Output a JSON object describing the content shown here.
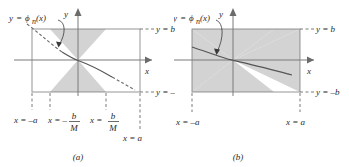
{
  "figure": {
    "title": "",
    "type": "math-diagram"
  },
  "colors": {
    "shade": "#d0d0d0",
    "line": "#6b6b6b",
    "curve": "#555555",
    "text": "#2a2a2a",
    "background": "#ffffff"
  },
  "panel_a": {
    "caption": "(a)",
    "function_label": {
      "y": "y",
      "eq": "=",
      "phi": "ϕ",
      "sub": "n",
      "arg": "(x)"
    },
    "axis_labels": {
      "x": "x",
      "y": "y"
    },
    "right_labels": {
      "top": "y = b",
      "bottom": "y = –b"
    },
    "bottom_labels": [
      {
        "prefix": "x = –a",
        "num": "",
        "den": ""
      },
      {
        "prefix": "x = –",
        "num": "b",
        "den": "M"
      },
      {
        "prefix": "x = ",
        "num": "b",
        "den": "M"
      }
    ],
    "corner_label": "x = a",
    "geometry": {
      "box_left": 32,
      "box_right": 140,
      "box_top": 29,
      "box_bottom": 92,
      "origin_x": 78,
      "origin_y": 60,
      "cone_half_width": 28
    }
  },
  "panel_b": {
    "caption": "(b)",
    "function_label": {
      "y": "y",
      "eq": "=",
      "phi": "ϕ",
      "sub": "n",
      "arg": "(x)"
    },
    "axis_labels": {
      "x": "x",
      "y": "y"
    },
    "right_labels": {
      "top": "y = b",
      "bottom": "y = –b"
    },
    "bottom_labels": [
      {
        "prefix": "x = –a",
        "num": "",
        "den": ""
      },
      {
        "prefix": "x = a",
        "num": "",
        "den": ""
      }
    ],
    "geometry": {
      "box_left": 18,
      "box_right": 126,
      "box_top": 29,
      "box_bottom": 92,
      "origin_x": 59,
      "origin_y": 60,
      "cone_half_width": 67
    }
  }
}
